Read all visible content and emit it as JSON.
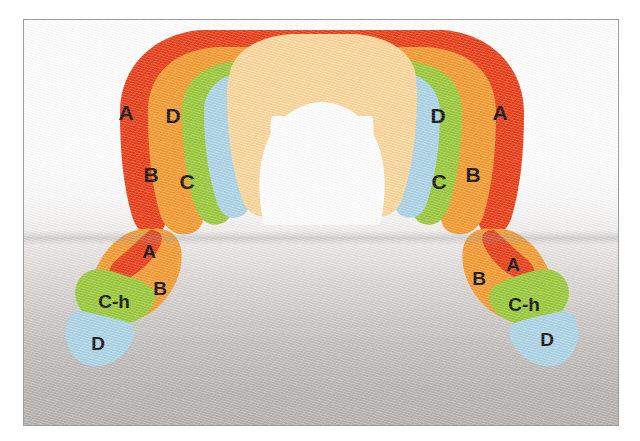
{
  "figure": {
    "title": "",
    "kind": "anatomical-zone-diagram",
    "background": {
      "top_color": "#ffffff",
      "bottom_color": "#b6b2af",
      "frame_border_color": "#9d9d9d"
    }
  },
  "palette": {
    "zone_a": "#e8401a",
    "zone_b": "#f49c33",
    "zone_c": "#9bc93c",
    "zone_d": "#acd4e6",
    "interior": "#fad79b",
    "label_color": "#111111"
  },
  "legend_zones": [
    {
      "key": "A",
      "label": "A",
      "color": "#e8401a"
    },
    {
      "key": "B",
      "label": "B",
      "color": "#f49c33"
    },
    {
      "key": "C",
      "label": "C",
      "color": "#9bc93c"
    },
    {
      "key": "C-h",
      "label": "C-h",
      "color": "#9bc93c"
    },
    {
      "key": "D",
      "label": "D",
      "color": "#acd4e6"
    }
  ],
  "shapes": {
    "upper_arch": {
      "name": "upper-arch",
      "labels": [
        {
          "id": "arch-left-a",
          "text": "A",
          "x": 125,
          "y": 112,
          "size": "big"
        },
        {
          "id": "arch-left-d",
          "text": "D",
          "x": 172,
          "y": 115,
          "size": "big"
        },
        {
          "id": "arch-left-b",
          "text": "B",
          "x": 150,
          "y": 173,
          "size": "big"
        },
        {
          "id": "arch-left-c",
          "text": "C",
          "x": 186,
          "y": 180,
          "size": "big"
        },
        {
          "id": "arch-right-d",
          "text": "D",
          "x": 437,
          "y": 115,
          "size": "big"
        },
        {
          "id": "arch-right-a",
          "text": "A",
          "x": 499,
          "y": 112,
          "size": "big"
        },
        {
          "id": "arch-right-c",
          "text": "C",
          "x": 438,
          "y": 180,
          "size": "big"
        },
        {
          "id": "arch-right-b",
          "text": "B",
          "x": 472,
          "y": 173,
          "size": "big"
        }
      ]
    },
    "lower_left": {
      "name": "lower-left-blob",
      "labels": [
        {
          "id": "ll-a",
          "text": "A",
          "x": 148,
          "y": 255,
          "size": "small"
        },
        {
          "id": "ll-b",
          "text": "B",
          "x": 159,
          "y": 292,
          "size": "small"
        },
        {
          "id": "ll-ch",
          "text": "C-h",
          "x": 90,
          "y": 319,
          "size": "small"
        },
        {
          "id": "ll-d",
          "text": "D",
          "x": 96,
          "y": 359,
          "size": "small"
        }
      ]
    },
    "lower_right": {
      "name": "lower-right-blob",
      "labels": [
        {
          "id": "lr-a",
          "text": "A",
          "x": 512,
          "y": 270,
          "size": "small"
        },
        {
          "id": "lr-b",
          "text": "B",
          "x": 478,
          "y": 284,
          "size": "small"
        },
        {
          "id": "lr-ch",
          "text": "C-h",
          "x": 514,
          "y": 322,
          "size": "small"
        },
        {
          "id": "lr-d",
          "text": "D",
          "x": 539,
          "y": 355,
          "size": "small"
        }
      ]
    }
  }
}
